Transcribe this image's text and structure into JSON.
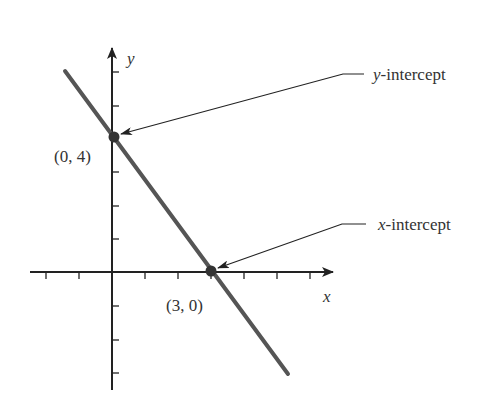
{
  "diagram": {
    "title": "",
    "axes": {
      "x_label": "x",
      "y_label": "y",
      "x_ticks": [
        -2,
        -1,
        1,
        2,
        3,
        4,
        5,
        6
      ],
      "y_ticks": [
        -3,
        -2,
        -1,
        1,
        2,
        3,
        4,
        5,
        6
      ]
    },
    "line": {
      "equation": "y = -4/3 x + 4",
      "slope": -1.3333,
      "y_intercept": 4,
      "x_intercept": 3
    },
    "points": [
      {
        "name": "y-intercept-point",
        "x": 0,
        "y": 4,
        "label": "(0, 4)"
      },
      {
        "name": "x-intercept-point",
        "x": 3,
        "y": 0,
        "label": "(3, 0)"
      }
    ],
    "annotations": {
      "y_intercept": {
        "var": "y",
        "rest": "-intercept"
      },
      "x_intercept": {
        "var": "x",
        "rest": "-intercept"
      }
    },
    "colors": {
      "axis": "#222222",
      "line": "#555555",
      "point": "#333333",
      "text": "#333333"
    }
  }
}
